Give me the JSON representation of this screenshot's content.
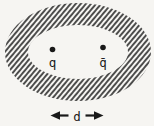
{
  "figure": {
    "background": "#f6f5f2",
    "ink": "#191919",
    "particles": [
      {
        "label": "q"
      },
      {
        "label": "q̄"
      }
    ],
    "separation": {
      "label": "d"
    },
    "icons": {
      "left_arrowhead": "◀",
      "right_arrowhead": "▶"
    }
  }
}
